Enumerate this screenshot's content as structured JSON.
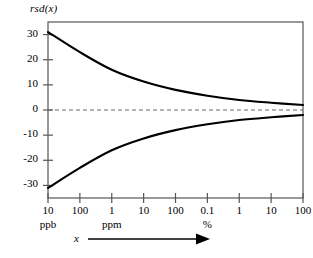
{
  "chart_data": {
    "type": "line",
    "title": "",
    "ylabel": "rsd(x)",
    "xlabel": "x",
    "ylim": [
      -35,
      35
    ],
    "yticks": [
      30,
      20,
      10,
      0,
      -10,
      -20,
      -30
    ],
    "ytick_labels": [
      "30",
      "20",
      "10",
      "0",
      "-10",
      "-20",
      "-30"
    ],
    "xtick_labels": [
      "10",
      "100",
      "1",
      "10",
      "100",
      "0.1",
      "1",
      "10",
      "100"
    ],
    "xtick_units": [
      "ppb",
      "",
      "ppm",
      "",
      "",
      "%",
      "",
      "",
      ""
    ],
    "unit_groups": [
      {
        "label": "ppb",
        "at_tick_index": 0
      },
      {
        "label": "ppm",
        "at_tick_index": 2
      },
      {
        "label": "%",
        "at_tick_index": 5
      }
    ],
    "grid": false,
    "legend": false,
    "zero_line": {
      "value": 0,
      "style": "dashed"
    },
    "series": [
      {
        "name": "upper",
        "style": "solid",
        "color": "#000000",
        "values": [
          31.0,
          23.0,
          16.0,
          11.3,
          8.0,
          5.7,
          4.0,
          2.9,
          2.0
        ]
      },
      {
        "name": "lower",
        "style": "solid",
        "color": "#000000",
        "values": [
          -31.0,
          -23.0,
          -16.0,
          -11.3,
          -8.0,
          -5.7,
          -4.0,
          -2.9,
          -2.0
        ]
      }
    ],
    "axis_arrow": {
      "label": "x",
      "direction": "right"
    },
    "colors": {
      "axis": "#555555",
      "curve": "#000000",
      "zero_line": "#666666"
    }
  }
}
